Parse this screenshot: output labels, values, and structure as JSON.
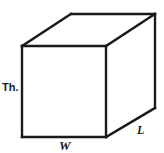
{
  "figure": {
    "shape": "cuboid",
    "background_color": "#ffffff",
    "stroke_color": "#1a1a1a",
    "labels": {
      "thickness": "Th.",
      "width": "W",
      "length": "L"
    },
    "geometry": {
      "front_face": {
        "top_left": [
          22,
          46
        ],
        "top_right": [
          106,
          46
        ],
        "bottom_right": [
          106,
          137
        ],
        "bottom_left": [
          22,
          137
        ]
      },
      "back_offset": [
        49,
        -32
      ],
      "top_back_left": [
        71,
        14
      ],
      "top_back_right": [
        155,
        14
      ],
      "right_back_bottom": [
        155,
        108
      ]
    }
  }
}
